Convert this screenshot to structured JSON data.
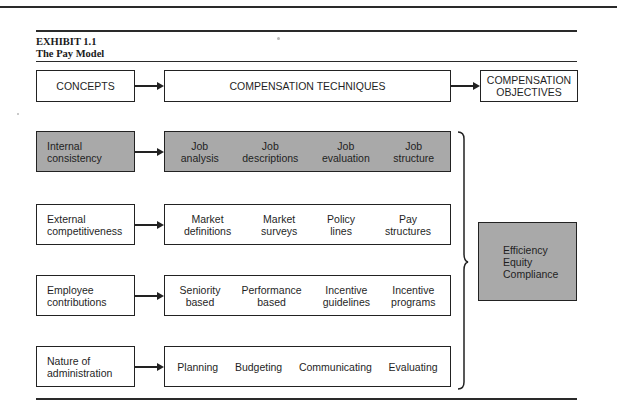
{
  "exhibit": {
    "number": "EXHIBIT 1.1",
    "title": "The Pay Model"
  },
  "header": {
    "concepts": "CONCEPTS",
    "techniques": "COMPENSATION TECHNIQUES",
    "objectives_line1": "COMPENSATION",
    "objectives_line2": "OBJECTIVES"
  },
  "rows": [
    {
      "concept": [
        "Internal",
        "consistency"
      ],
      "highlighted": true,
      "techniques": [
        [
          "Job",
          "analysis"
        ],
        [
          "Job",
          "descriptions"
        ],
        [
          "Job",
          "evaluation"
        ],
        [
          "Job",
          "structure"
        ]
      ]
    },
    {
      "concept": [
        "External",
        "competitiveness"
      ],
      "highlighted": false,
      "techniques": [
        [
          "Market",
          "definitions"
        ],
        [
          "Market",
          "surveys"
        ],
        [
          "Policy",
          "lines"
        ],
        [
          "Pay",
          "structures"
        ]
      ]
    },
    {
      "concept": [
        "Employee",
        "contributions"
      ],
      "highlighted": false,
      "techniques": [
        [
          "Seniority",
          "based"
        ],
        [
          "Performance",
          "based"
        ],
        [
          "Incentive",
          "guidelines"
        ],
        [
          "Incentive",
          "programs"
        ]
      ]
    },
    {
      "concept": [
        "Nature of",
        "administration"
      ],
      "highlighted": false,
      "techniques": [
        [
          "Planning"
        ],
        [
          "Budgeting"
        ],
        [
          "Communicating"
        ],
        [
          "Evaluating"
        ]
      ]
    }
  ],
  "objectives": [
    "Efficiency",
    "Equity",
    "Compliance"
  ],
  "colors": {
    "highlight_fill": "#a9a9a9",
    "line": "#222222"
  }
}
